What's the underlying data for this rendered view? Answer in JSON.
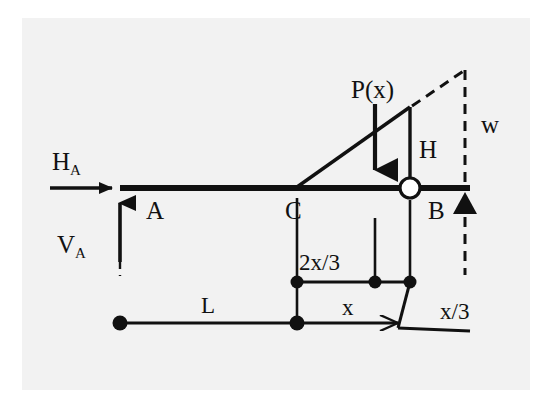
{
  "figure": {
    "kind": "structural-free-body-diagram",
    "title_text": "",
    "background_color": "#ffffff",
    "plate_color": "#f2f2f2",
    "ink_color": "#111111"
  },
  "labels": {
    "reaction_horizontal": {
      "base": "H",
      "sub": "A"
    },
    "reaction_vertical": {
      "base": "V",
      "sub": "A"
    },
    "node_a": "A",
    "node_b": "B",
    "node_c": "C",
    "load_resultant": "P(x)",
    "load_height": "H",
    "load_intensity": "w",
    "span_total": "L",
    "span_loaded": "x",
    "centroid_left": "2x/3",
    "centroid_right": "x/3"
  },
  "geometry": {
    "beam": {
      "x1": 120,
      "y": 188,
      "x2": 470,
      "thickness": 6
    },
    "point_a": {
      "x": 120,
      "y": 188
    },
    "point_c": {
      "x": 297,
      "y": 188
    },
    "point_b": {
      "x": 410,
      "y": 188
    },
    "roller_radius": 10,
    "load_triangle": {
      "apex_left_x": 297,
      "top_right_x": 410,
      "top_y": 107,
      "base_y": 188
    },
    "dashed_triangle": {
      "from_x": 410,
      "from_y": 107,
      "apex_x": 465,
      "apex_y": 70,
      "drop_to_y": 275
    },
    "resultant_arrow": {
      "x": 375,
      "y_top": 104,
      "y_bottom": 190
    },
    "h_arrow": {
      "x_start": 50,
      "x_end": 122,
      "y": 188
    },
    "v_arrow": {
      "x": 120,
      "y_top": 190,
      "y_bottom": 262
    },
    "dim_upper": {
      "y": 282,
      "x_left": 297,
      "x_mid": 375,
      "x_right": 410
    },
    "dim_lower": {
      "y": 323,
      "x_left": 120,
      "x_mid": 297,
      "x_right": 412
    },
    "leader_x3": {
      "x1": 410,
      "y1": 282,
      "x2": 398,
      "y2": 327,
      "x3": 470,
      "y3": 330
    }
  },
  "colors": {
    "stroke": "#111111",
    "fill": "#111111",
    "roller_fill": "#ffffff"
  }
}
